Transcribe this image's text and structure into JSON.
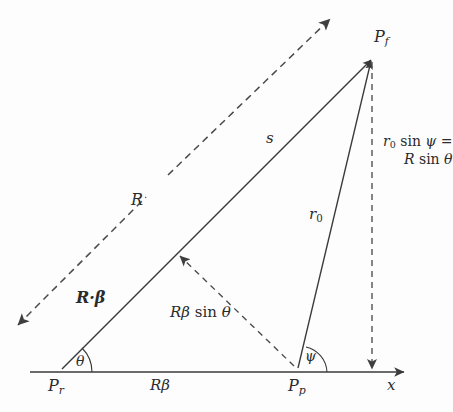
{
  "figure": {
    "background_color": "#fdfdfd",
    "ink_color": "#3a3a3a",
    "width": 451,
    "height": 412
  },
  "points": {
    "retarded": {
      "label_html": "P<span class=\"sub\">r</span>",
      "plain": "P_r",
      "x": 58,
      "y": 372
    },
    "present": {
      "label_html": "P<span class=\"sub\">p</span>",
      "plain": "P_p",
      "x": 300,
      "y": 372
    },
    "field": {
      "label_html": "P<span class=\"sub\">f</span>",
      "plain": "P_f",
      "x": 372,
      "y": 57
    }
  },
  "labels": {
    "p_r": "P_r",
    "p_p": "P_p",
    "p_f": "P_f",
    "s": "s",
    "r_zero": "r_0",
    "big_r": "R",
    "r_beta_vector": "R·β",
    "r_beta_sin_theta": "Rβ sin θ",
    "r_beta": "Rβ",
    "theta": "θ",
    "psi": "ψ",
    "x_axis": "x",
    "height_line1": "r_0 sin ψ =",
    "height_line2": "R sin θ"
  },
  "segments": [
    {
      "name": "baseline-axis",
      "from": "P_r",
      "to": "x-arrow",
      "style": "solid",
      "arrow": "end"
    },
    {
      "name": "retarded-to-field",
      "from": "P_r",
      "to": "P_f",
      "style": "solid",
      "arrow": "end",
      "measure": "s"
    },
    {
      "name": "present-to-field",
      "from": "P_p",
      "to": "P_f",
      "style": "solid",
      "arrow": "end",
      "measure": "r_0"
    },
    {
      "name": "velocity-vector-R",
      "style": "dashed",
      "arrow": "both",
      "measure": "R"
    },
    {
      "name": "perpendicular-drop",
      "from": "P_p",
      "to": "s-line",
      "style": "dashed",
      "arrow": "both",
      "measure": "Rβ sin θ"
    },
    {
      "name": "field-height-drop",
      "from": "P_f",
      "to": "x-axis",
      "style": "dashed",
      "arrow": "end",
      "measure": "r_0 sin ψ = R sin θ"
    }
  ],
  "angles": [
    {
      "name": "theta",
      "symbol": "θ",
      "vertex": "P_r",
      "between": [
        "baseline-axis",
        "retarded-to-field"
      ]
    },
    {
      "name": "psi",
      "symbol": "ψ",
      "vertex": "P_p",
      "between": [
        "baseline-axis",
        "present-to-field"
      ]
    }
  ]
}
